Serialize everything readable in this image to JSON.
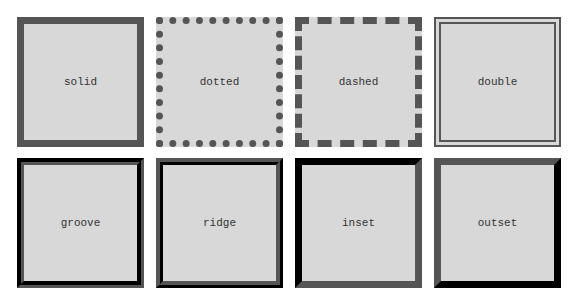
{
  "boxes": [
    {
      "style": "solid",
      "label": "solid"
    },
    {
      "style": "dotted",
      "label": "dotted"
    },
    {
      "style": "dashed",
      "label": "dashed"
    },
    {
      "style": "double",
      "label": "double"
    },
    {
      "style": "groove",
      "label": "groove"
    },
    {
      "style": "ridge",
      "label": "ridge"
    },
    {
      "style": "inset",
      "label": "inset"
    },
    {
      "style": "outset",
      "label": "outset"
    }
  ],
  "colors": {
    "border": "#555555",
    "fill": "#d8d8d8",
    "background": "#ffffff",
    "text": "#333333"
  }
}
